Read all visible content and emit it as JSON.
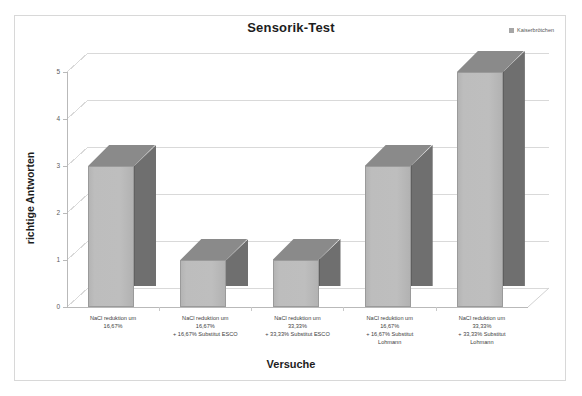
{
  "chart_data": {
    "type": "bar",
    "title": "Sensorik-Test",
    "xlabel": "Versuche",
    "ylabel": "richtige Antworten",
    "ylim": [
      0,
      5
    ],
    "yticks": [
      "0",
      "1",
      "2",
      "3",
      "4",
      "5"
    ],
    "grid": true,
    "legend_position": "top-right",
    "style": "3d-column",
    "categories": [
      "NaCl reduktion um 16,67%",
      "NaCl reduktion um 16,67% + 16,67% Substitut ESCO",
      "NaCl reduktion um 33,33% + 33,33% Substitut ESCO",
      "NaCl reduktion um 16,67% + 16,67% Substitut Lohmann",
      "NaCl reduktion um 33,33% + 33,33% Substitut Lohmann"
    ],
    "category_lines": [
      [
        "NaCl reduktion um",
        "16,67%"
      ],
      [
        "NaCl reduktion um",
        "16,67%",
        "+ 16,67% Substitut ESCO"
      ],
      [
        "NaCl reduktion um",
        "33,33%",
        "+ 33,33% Substitut ESCO"
      ],
      [
        "NaCl reduktion um",
        "16,67%",
        "+ 16,67% Substitut",
        "Lohmann"
      ],
      [
        "NaCl reduktion um",
        "33,33%",
        "+ 33,33% Substitut",
        "Lohmann"
      ]
    ],
    "series": [
      {
        "name": "Kaiserbrötchen",
        "values": [
          3,
          1,
          1,
          3,
          5
        ],
        "color": "#bebebe"
      }
    ]
  },
  "legend": {
    "entries": [
      {
        "label": "Kaiserbrötchen",
        "color": "#a6a6a6"
      }
    ]
  },
  "colors": {
    "bar_front": "#bebebe",
    "bar_side": "#6f6f6f",
    "bar_top": "#8a8a8a",
    "grid": "#dcdcdc",
    "frame": "#d8d8d8",
    "text": "#2b2b2b"
  }
}
